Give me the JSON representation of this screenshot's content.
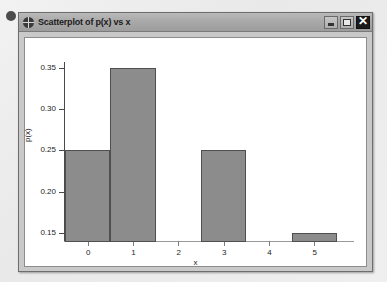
{
  "window": {
    "title": "Scatterplot of p(x) vs x",
    "app_icon": "crosshair-circle-icon",
    "buttons": {
      "minimize": "minimize-icon",
      "maximize": "maximize-icon",
      "close": "✕"
    }
  },
  "chart_data": {
    "type": "bar",
    "title": "Scatterplot of p(x) vs x",
    "xlabel": "x",
    "ylabel": "p(x)",
    "categories": [
      "0",
      "1",
      "2",
      "3",
      "4",
      "5"
    ],
    "values": [
      0.25,
      0.35,
      0,
      0.25,
      0,
      0.15
    ],
    "xticks": [
      "0",
      "1",
      "2",
      "3",
      "4",
      "5"
    ],
    "yticks": [
      "0.15",
      "0.20",
      "0.25",
      "0.30",
      "0.35"
    ],
    "ylim": [
      0.139,
      0.357
    ],
    "xlim": [
      -0.5,
      5.5
    ],
    "grid": false,
    "legend": "none",
    "bar_color": "#8c8c8c",
    "bar_edge_color": "#4f4f4f",
    "plot_background": "#ffffff"
  }
}
